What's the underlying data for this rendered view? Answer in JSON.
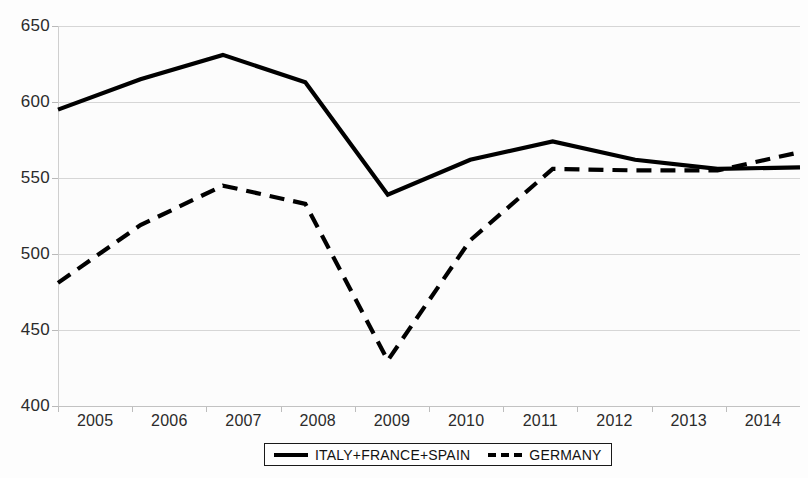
{
  "chart_data": {
    "type": "line",
    "title": "",
    "xlabel": "",
    "ylabel": "",
    "categories": [
      "2005",
      "2006",
      "2007",
      "2008",
      "2009",
      "2010",
      "2011",
      "2012",
      "2013",
      "2014"
    ],
    "ylim": [
      400,
      650
    ],
    "yticks": [
      400,
      450,
      500,
      550,
      600,
      650
    ],
    "grid": true,
    "legend_position": "bottom",
    "series": [
      {
        "name": "ITALY+FRANCE+SPAIN",
        "style": "solid",
        "color": "#000000",
        "values": [
          595,
          615,
          631,
          613,
          539,
          562,
          574,
          562,
          556,
          557
        ]
      },
      {
        "name": "GERMANY",
        "style": "dashed",
        "color": "#000000",
        "values": [
          481,
          519,
          545,
          533,
          430,
          509,
          556,
          555,
          555,
          567
        ]
      }
    ]
  },
  "legend": {
    "entries": [
      {
        "label": "ITALY+FRANCE+SPAIN",
        "style": "solid"
      },
      {
        "label": "GERMANY",
        "style": "dashed"
      }
    ]
  },
  "colors": {
    "series": "#000000",
    "gridline": "#d6d6d6",
    "background": "#fdfdfd",
    "tick_text": "#2b2b2b"
  }
}
